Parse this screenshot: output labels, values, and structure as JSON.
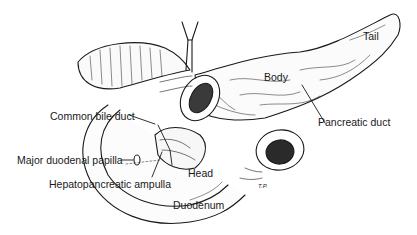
{
  "figure": {
    "labels": {
      "tail": "Tail",
      "body": "Body",
      "common_bile_duct": "Common bile duct",
      "pancreatic_duct": "Pancreatic duct",
      "major_duodenal_papilla": "Major duodenal papilla",
      "hepatopancreatic_ampulla": "Hepatopancreatic ampulla",
      "head": "Head",
      "duodenum": "Duodenum"
    },
    "artist_initials": "T.P.",
    "colors": {
      "ink": "#1a1a1a",
      "background": "#ffffff"
    }
  }
}
